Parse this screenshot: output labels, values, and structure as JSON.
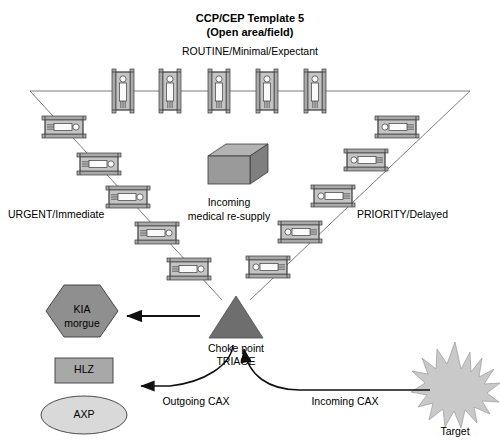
{
  "diagram": {
    "title_line1": "CCP/CEP Template 5",
    "title_line2": "(Open area/field)",
    "categories": {
      "routine": "ROUTINE/Minimal/Expectant",
      "urgent": "URGENT/Immediate",
      "priority": "PRIORITY/Delayed"
    },
    "resupply": {
      "line1": "Incoming",
      "line2": "medical re-supply",
      "shape": "box-3d-icon",
      "fill": "#8c8c8c"
    },
    "triage": {
      "line1": "Choke point",
      "line2": "TRIAGE",
      "shape": "triangle-icon",
      "fill": "#6e6e6e"
    },
    "nodes": [
      {
        "id": "kia-morgue",
        "line1": "KIA",
        "line2": "morgue",
        "shape": "hexagon-icon",
        "fill": "#8f8f8f"
      },
      {
        "id": "hlz",
        "line1": "HLZ",
        "line2": "",
        "shape": "rectangle-icon",
        "fill": "#a8a8a8"
      },
      {
        "id": "axp",
        "line1": "AXP",
        "line2": "",
        "shape": "ellipse-icon",
        "fill": "#d9d9d9"
      },
      {
        "id": "target",
        "line1": "Target",
        "line2": "",
        "shape": "starburst-icon",
        "fill": "#c9c9c9"
      }
    ],
    "flows": [
      {
        "id": "triage-to-kia",
        "label": ""
      },
      {
        "id": "outgoing-cax",
        "label": "Outgoing CAX"
      },
      {
        "id": "incoming-cax",
        "label": "Incoming CAX"
      }
    ],
    "litters": {
      "routine_count": 5,
      "urgent_count": 5,
      "priority_count": 5
    }
  }
}
